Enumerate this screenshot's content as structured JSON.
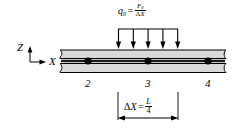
{
  "figure": {
    "width": 245,
    "height": 128,
    "background": "#ffffff"
  },
  "load": {
    "symbol": "q",
    "symbol_subscript": "0",
    "equals": "=",
    "numerator": "F",
    "numerator_subscript": "0",
    "denominator_delta": "Δ",
    "denominator_var": "X",
    "formula_text": "q0 = F0 / ΔX",
    "arrow_count": 5,
    "arrow_color": "#000000",
    "direction": "down"
  },
  "axes": {
    "vertical_label": "Z",
    "horizontal_label": "X",
    "origin_x": 30,
    "origin_y": 62,
    "color": "#000000"
  },
  "beam": {
    "fill_color": "#d9d9d9",
    "outline_color": "#000000",
    "centerline_color": "#1a1a1a",
    "left_break": "wavy-break",
    "right_break": "wavy-break"
  },
  "nodes": [
    {
      "label": "2",
      "x": 88,
      "y": 61
    },
    {
      "label": "3",
      "x": 148,
      "y": 61
    },
    {
      "label": "4",
      "x": 208,
      "y": 61
    }
  ],
  "dimension": {
    "delta": "Δ",
    "variable": "X",
    "equals": "=",
    "numerator": "L",
    "denominator": "4",
    "label_text": "ΔX = L/4",
    "start_x": 118,
    "end_x": 178,
    "line_y": 118
  }
}
